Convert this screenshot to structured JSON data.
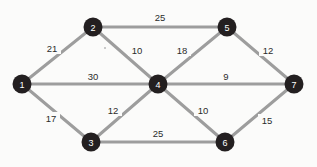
{
  "diagram": {
    "type": "node-link-graph",
    "canvas": {
      "width": 317,
      "height": 167
    },
    "colors": {
      "background": "#fbfbfa",
      "node_fill": "#231f20",
      "node_text": "#ffffff",
      "edge_stroke": "#9d9d9d",
      "weight_text": "#2b2b2b"
    },
    "node_radius": 9.5,
    "edge_width": 3,
    "nodes": [
      {
        "id": "1",
        "label": "1",
        "x": 22,
        "y": 84
      },
      {
        "id": "2",
        "label": "2",
        "x": 93,
        "y": 27
      },
      {
        "id": "3",
        "label": "3",
        "x": 91,
        "y": 142
      },
      {
        "id": "4",
        "label": "4",
        "x": 158,
        "y": 84
      },
      {
        "id": "5",
        "label": "5",
        "x": 227,
        "y": 27
      },
      {
        "id": "6",
        "label": "6",
        "x": 225,
        "y": 142
      },
      {
        "id": "7",
        "label": "7",
        "x": 294,
        "y": 84
      }
    ],
    "edges": [
      {
        "source": "1",
        "target": "2",
        "weight": "21",
        "lx": 52,
        "ly": 48
      },
      {
        "source": "1",
        "target": "4",
        "weight": "30",
        "lx": 93,
        "ly": 76
      },
      {
        "source": "1",
        "target": "3",
        "weight": "17",
        "lx": 51,
        "ly": 118
      },
      {
        "source": "2",
        "target": "5",
        "weight": "25",
        "lx": 160,
        "ly": 17
      },
      {
        "source": "2",
        "target": "4",
        "weight": "10",
        "lx": 137,
        "ly": 50
      },
      {
        "source": "3",
        "target": "4",
        "weight": "12",
        "lx": 113,
        "ly": 110
      },
      {
        "source": "3",
        "target": "6",
        "weight": "25",
        "lx": 158,
        "ly": 133
      },
      {
        "source": "4",
        "target": "5",
        "weight": "18",
        "lx": 182,
        "ly": 50
      },
      {
        "source": "4",
        "target": "7",
        "weight": "9",
        "lx": 226,
        "ly": 76
      },
      {
        "source": "4",
        "target": "6",
        "weight": "10",
        "lx": 203,
        "ly": 110
      },
      {
        "source": "5",
        "target": "7",
        "weight": "12",
        "lx": 268,
        "ly": 50
      },
      {
        "source": "6",
        "target": "7",
        "weight": "15",
        "lx": 267,
        "ly": 120
      }
    ]
  }
}
